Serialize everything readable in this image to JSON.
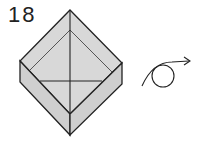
{
  "step": {
    "number": "18"
  },
  "diagram": {
    "fill_color": "#d8d8d8",
    "side_fill_color": "#cfcfcf",
    "line_color": "#222222",
    "annotation": "turn-over-arrow"
  }
}
